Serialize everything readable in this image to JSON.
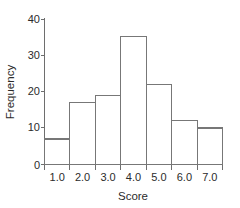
{
  "chart_data": {
    "type": "bar",
    "title": "",
    "xlabel": "Score",
    "ylabel": "Frequency",
    "categories": [
      "1.0",
      "2.0",
      "3.0",
      "4.0",
      "5.0",
      "6.0",
      "7.0"
    ],
    "values": [
      7,
      17,
      19,
      35,
      22,
      12,
      10
    ],
    "bin_edges": [
      0.5,
      1.5,
      2.5,
      3.5,
      4.5,
      5.5,
      6.5,
      7.5
    ],
    "xlim": [
      0.5,
      7.5
    ],
    "ylim": [
      0,
      40
    ],
    "x_tick_labels": [
      "1.0",
      "2.0",
      "3.0",
      "4.0",
      "5.0",
      "6.0",
      "7.0"
    ],
    "y_tick_labels": [
      "0",
      "10",
      "20",
      "30",
      "40"
    ],
    "y_ticks": [
      0,
      10,
      20,
      30,
      40
    ],
    "grid": false,
    "legend": null,
    "legend_position": "none",
    "bar_fill_color": "#ffffff",
    "bar_stroke_color": "#777777",
    "axis_color": "#6e6e6e",
    "text_color": "#2b2b2b",
    "background_color": "#ffffff"
  }
}
